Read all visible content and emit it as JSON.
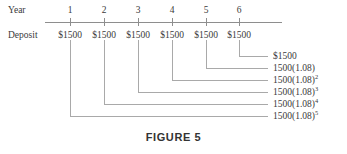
{
  "figure": {
    "caption": "FIGURE 5",
    "row_labels": {
      "year": "Year",
      "deposit": "Deposit"
    },
    "axis": {
      "x_start": 45,
      "x_end": 282,
      "y": 22
    },
    "years": [
      {
        "label": "1",
        "x": 70
      },
      {
        "label": "2",
        "x": 104
      },
      {
        "label": "3",
        "x": 138
      },
      {
        "label": "4",
        "x": 172
      },
      {
        "label": "5",
        "x": 206
      },
      {
        "label": "6",
        "x": 239
      }
    ],
    "deposits": [
      {
        "amount": "$1500",
        "x": 70
      },
      {
        "amount": "$1500",
        "x": 104
      },
      {
        "amount": "$1500",
        "x": 138
      },
      {
        "amount": "$1500",
        "x": 172
      },
      {
        "amount": "$1500",
        "x": 206
      },
      {
        "amount": "$1500",
        "x": 239
      }
    ],
    "values": [
      {
        "prefix": "$1500",
        "exponent": "",
        "source_x": 239,
        "elbow_y": 56,
        "label_x": 273,
        "label_y": 52
      },
      {
        "prefix": "1500(1.08)",
        "exponent": "",
        "source_x": 206,
        "elbow_y": 68,
        "label_x": 273,
        "label_y": 64
      },
      {
        "prefix": "1500(1.08)",
        "exponent": "2",
        "source_x": 172,
        "elbow_y": 80,
        "label_x": 273,
        "label_y": 76
      },
      {
        "prefix": "1500(1.08)",
        "exponent": "3",
        "source_x": 138,
        "elbow_y": 92,
        "label_x": 273,
        "label_y": 88
      },
      {
        "prefix": "1500(1.08)",
        "exponent": "4",
        "source_x": 104,
        "elbow_y": 104,
        "label_x": 273,
        "label_y": 100
      },
      {
        "prefix": "1500(1.08)",
        "exponent": "5",
        "source_x": 70,
        "elbow_y": 116,
        "label_x": 273,
        "label_y": 112
      }
    ],
    "colors": {
      "axis": "#8e8e8e",
      "connector": "#a9a9a9",
      "text": "#3a3a3a",
      "caption": "#333333"
    },
    "geometry": {
      "year_label_y": 6,
      "deposit_label_y": 31,
      "tick_top": 18,
      "tick_height": 8,
      "drop_top": 40,
      "connector_right_x": 268,
      "caption_y": 131,
      "row_label_x": 8
    }
  }
}
